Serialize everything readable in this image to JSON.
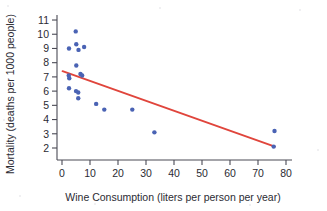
{
  "chart_data": {
    "type": "scatter",
    "title": "",
    "xlabel": "Wine Consumption (liters per person per year)",
    "ylabel": "Mortality (deaths per 1000 people)",
    "xlim": [
      0,
      80
    ],
    "ylim": [
      2,
      11
    ],
    "xticks": [
      0,
      10,
      20,
      30,
      40,
      50,
      60,
      70,
      80
    ],
    "yticks": [
      2,
      3,
      4,
      5,
      6,
      7,
      8,
      9,
      10,
      11
    ],
    "grid": false,
    "legend": null,
    "point_color": "#4a63b4",
    "trend_color": "#e0453c",
    "points": [
      {
        "x": 4.9,
        "y": 10.2
      },
      {
        "x": 2.5,
        "y": 9.0
      },
      {
        "x": 5.1,
        "y": 9.3
      },
      {
        "x": 5.9,
        "y": 8.9
      },
      {
        "x": 7.9,
        "y": 9.1
      },
      {
        "x": 5.1,
        "y": 7.8
      },
      {
        "x": 2.4,
        "y": 7.1
      },
      {
        "x": 2.6,
        "y": 6.9
      },
      {
        "x": 6.6,
        "y": 7.2
      },
      {
        "x": 7.2,
        "y": 7.1
      },
      {
        "x": 2.5,
        "y": 6.2
      },
      {
        "x": 5.0,
        "y": 6.0
      },
      {
        "x": 5.8,
        "y": 5.9
      },
      {
        "x": 5.8,
        "y": 5.5
      },
      {
        "x": 12.2,
        "y": 5.1
      },
      {
        "x": 15.1,
        "y": 4.7
      },
      {
        "x": 25.1,
        "y": 4.7
      },
      {
        "x": 33.0,
        "y": 3.1
      },
      {
        "x": 75.9,
        "y": 3.2
      },
      {
        "x": 75.6,
        "y": 2.1
      }
    ],
    "trend": {
      "x0": 0.2,
      "y0": 7.4,
      "x1": 76.0,
      "y1": 2.1
    }
  },
  "axes": {
    "x_tick_labels": [
      "0",
      "10",
      "20",
      "30",
      "40",
      "50",
      "60",
      "70",
      "80"
    ],
    "y_tick_labels": [
      "2",
      "3",
      "4",
      "5",
      "6",
      "7",
      "8",
      "9",
      "10",
      "11"
    ],
    "x_title": "Wine Consumption (liters per person per year)",
    "y_title": "Mortality (deaths per 1000 people)"
  }
}
